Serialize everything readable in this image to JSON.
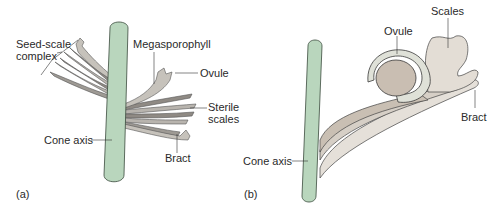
{
  "colors": {
    "axis_fill": "#b9d6bd",
    "axis_stroke": "#3a4a3c",
    "scale_fill": "#b8b4ae",
    "scale_dark": "#6f6b66",
    "scale_light": "#e2ddd6",
    "ovule_ring": "#dfe1d8",
    "ovule_core": "#c9beb2",
    "line": "#333333"
  },
  "panel_a": {
    "tag": "(a)",
    "labels": {
      "seed_scale_complex_1": "Seed-scale",
      "seed_scale_complex_2": "complex",
      "megasporophyll": "Megasporophyll",
      "ovule": "Ovule",
      "sterile_scales_1": "Sterile",
      "sterile_scales_2": "scales",
      "cone_axis": "Cone axis",
      "bract": "Bract"
    }
  },
  "panel_b": {
    "tag": "(b)",
    "labels": {
      "ovule": "Ovule",
      "scales": "Scales",
      "bract": "Bract",
      "cone_axis": "Cone axis"
    }
  }
}
